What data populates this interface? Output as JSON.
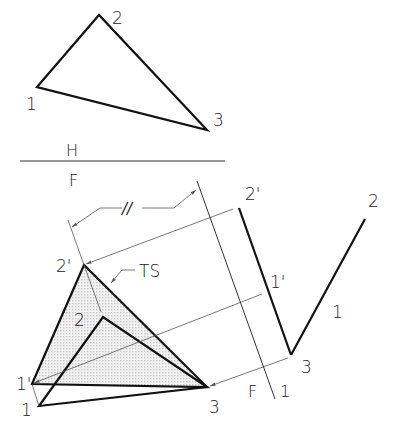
{
  "colors": {
    "object": "#111111",
    "construction": "#555555",
    "ts_fill": "#e2e2e2"
  },
  "top_view": {
    "labels": {
      "p1": "1",
      "p2": "2",
      "p3": "3"
    }
  },
  "fold_line_HF": {
    "upper": "H",
    "lower": "F"
  },
  "fold_line_F1": {
    "left": "F",
    "right": "1"
  },
  "edge_view": {
    "labels": {
      "p2": "2'",
      "p1": "1'",
      "p3": "3"
    }
  },
  "right_view": {
    "labels": {
      "p2": "2",
      "p1": "1",
      "p3": "3"
    }
  },
  "front_view": {
    "labels": {
      "p1": "1",
      "p2": "2",
      "p3": "3"
    }
  },
  "true_size_view": {
    "labels": {
      "p1": "1'",
      "p2": "2'"
    },
    "annotation": "TS"
  },
  "dimension": {
    "symbol": "//"
  }
}
